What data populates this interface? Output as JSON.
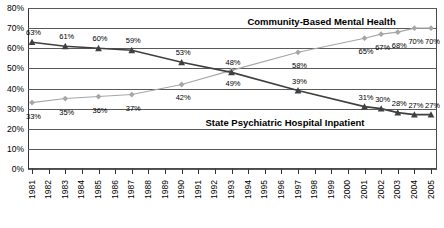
{
  "chart_data": {
    "type": "line",
    "title": "",
    "xlabel": "",
    "ylabel": "",
    "ylim": [
      0,
      80
    ],
    "ytick_labels": [
      "0%",
      "10%",
      "20%",
      "30%",
      "40%",
      "50%",
      "60%",
      "70%",
      "80%"
    ],
    "ytick_values": [
      0,
      10,
      20,
      30,
      40,
      50,
      60,
      70,
      80
    ],
    "grid": true,
    "legend_position": "inline-annotation",
    "x_axis_years": [
      "1981",
      "1982",
      "1983",
      "1984",
      "1985",
      "1986",
      "1987",
      "1988",
      "1989",
      "1990",
      "1991",
      "1992",
      "1993",
      "1994",
      "1995",
      "1996",
      "1997",
      "1998",
      "1999",
      "2000",
      "2001",
      "2002",
      "2003",
      "2004",
      "2005"
    ],
    "x": [
      1981,
      1983,
      1985,
      1987,
      1990,
      1993,
      1997,
      2001,
      2002,
      2003,
      2004,
      2005
    ],
    "series": [
      {
        "name": "Community-Based Mental Health",
        "color": "#a6a6a6",
        "marker": "diamond",
        "values": [
          33,
          35,
          36,
          37,
          42,
          49,
          58,
          65,
          67,
          68,
          70,
          70
        ],
        "labels": [
          "33%",
          "35%",
          "36%",
          "37%",
          "42%",
          "49%",
          "58%",
          "65%",
          "67%",
          "68%",
          "70%",
          "70%"
        ]
      },
      {
        "name": "State Psychiatric Hospital Inpatient",
        "color": "#404040",
        "marker": "triangle",
        "values": [
          63,
          61,
          60,
          59,
          53,
          48,
          39,
          31,
          30,
          28,
          27,
          27
        ],
        "labels": [
          "63%",
          "61%",
          "60%",
          "59%",
          "53%",
          "48%",
          "39%",
          "31%",
          "30%",
          "28%",
          "27%",
          "27%"
        ]
      }
    ],
    "annotations": [
      {
        "text": "Community-Based Mental Health",
        "series": "Community-Based Mental Health"
      },
      {
        "text": "State Psychiatric Hospital Inpatient",
        "series": "State Psychiatric Hospital Inpatient"
      }
    ]
  }
}
